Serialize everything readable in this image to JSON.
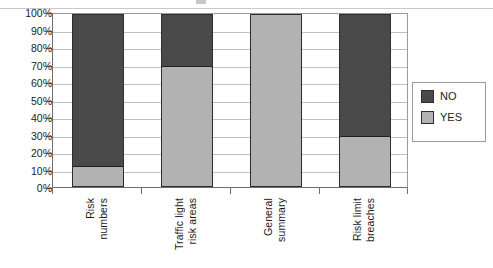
{
  "chart_data": {
    "type": "bar",
    "subtype": "stacked-100-percent",
    "title": "",
    "xlabel": "",
    "ylabel": "",
    "ylim": [
      0,
      100
    ],
    "yunit": "%",
    "grid": true,
    "legend_position": "right",
    "categories": [
      "Risk numbers",
      "Traffic light risk areas",
      "General summary",
      "Risk limit breaches"
    ],
    "category_lines": [
      [
        "Risk",
        "numbers"
      ],
      [
        "Traffic light",
        "risk areas"
      ],
      [
        "General",
        "summary"
      ],
      [
        "Risk limit",
        "breaches"
      ]
    ],
    "ytick_labels": [
      "100%",
      "90%",
      "80%",
      "70%",
      "60%",
      "50%",
      "40%",
      "30%",
      "20%",
      "10%",
      "0%"
    ],
    "ytick_values": [
      100,
      90,
      80,
      70,
      60,
      50,
      40,
      30,
      20,
      10,
      0
    ],
    "series": [
      {
        "name": "NO",
        "color": "#4a4a4a",
        "values": [
          89,
          30,
          0,
          71
        ]
      },
      {
        "name": "YES",
        "color": "#b2b2b2",
        "values": [
          11,
          70,
          100,
          29
        ]
      }
    ]
  },
  "legend": {
    "items": [
      {
        "label": "NO",
        "swatch": "no"
      },
      {
        "label": "YES",
        "swatch": "yes"
      }
    ]
  }
}
